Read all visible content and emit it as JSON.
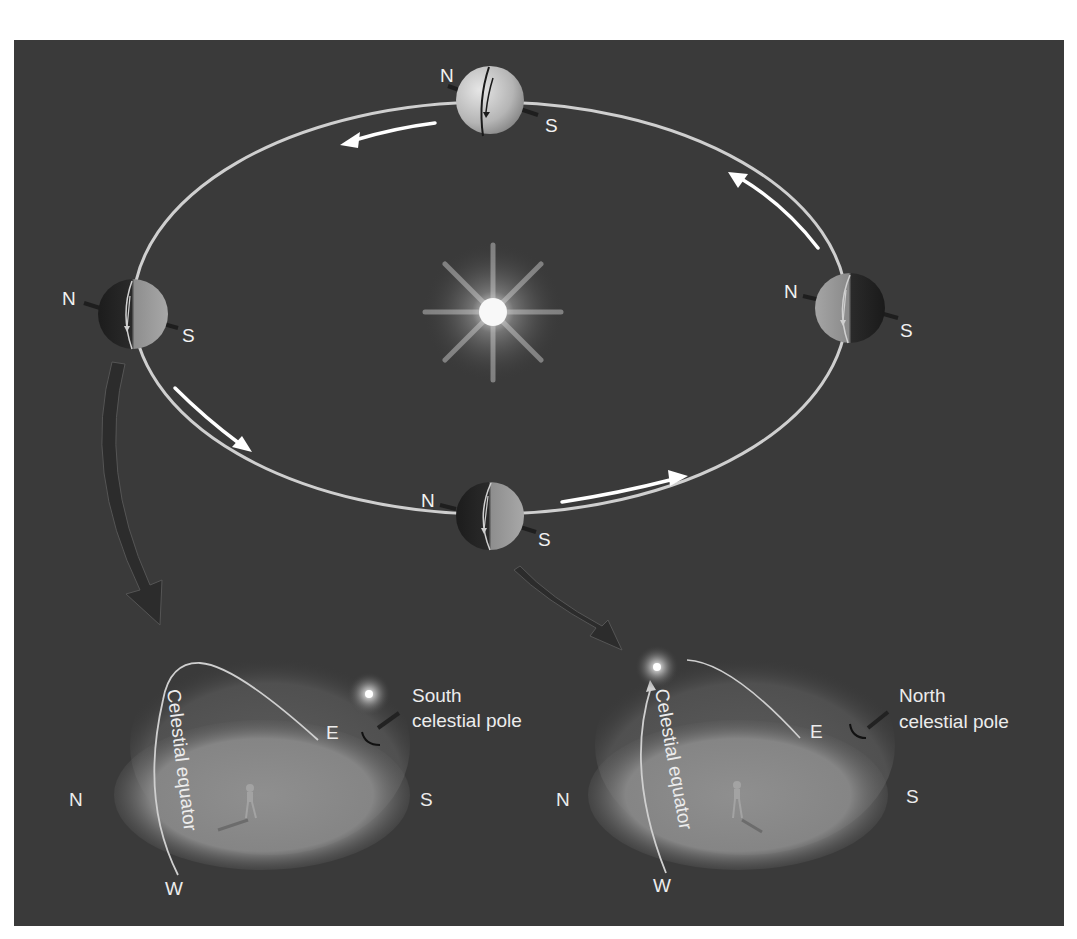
{
  "figure": {
    "colors": {
      "background": "#3a3a3a",
      "orbit": "#cfcfcf",
      "arrow": "#ffffff",
      "text": "#f2f2f2",
      "ground": "#8a8a8a",
      "dome": "#5a5a5a"
    }
  },
  "orbit": {
    "earths": [
      {
        "id": "top",
        "north_label": "N",
        "south_label": "S"
      },
      {
        "id": "left",
        "north_label": "N",
        "south_label": "S"
      },
      {
        "id": "right",
        "north_label": "N",
        "south_label": "S"
      },
      {
        "id": "bottom",
        "north_label": "N",
        "south_label": "S"
      }
    ],
    "sun": "sun-icon"
  },
  "domes": [
    {
      "id": "left",
      "band_label": "Celestial equator",
      "pole_label_line1": "South",
      "pole_label_line2": "celestial pole",
      "dir_n": "N",
      "dir_s": "S",
      "dir_e": "E",
      "dir_w": "W"
    },
    {
      "id": "right",
      "band_label": "Celestial equator",
      "pole_label_line1": "North",
      "pole_label_line2": "celestial pole",
      "dir_n": "N",
      "dir_s": "S",
      "dir_e": "E",
      "dir_w": "W"
    }
  ]
}
